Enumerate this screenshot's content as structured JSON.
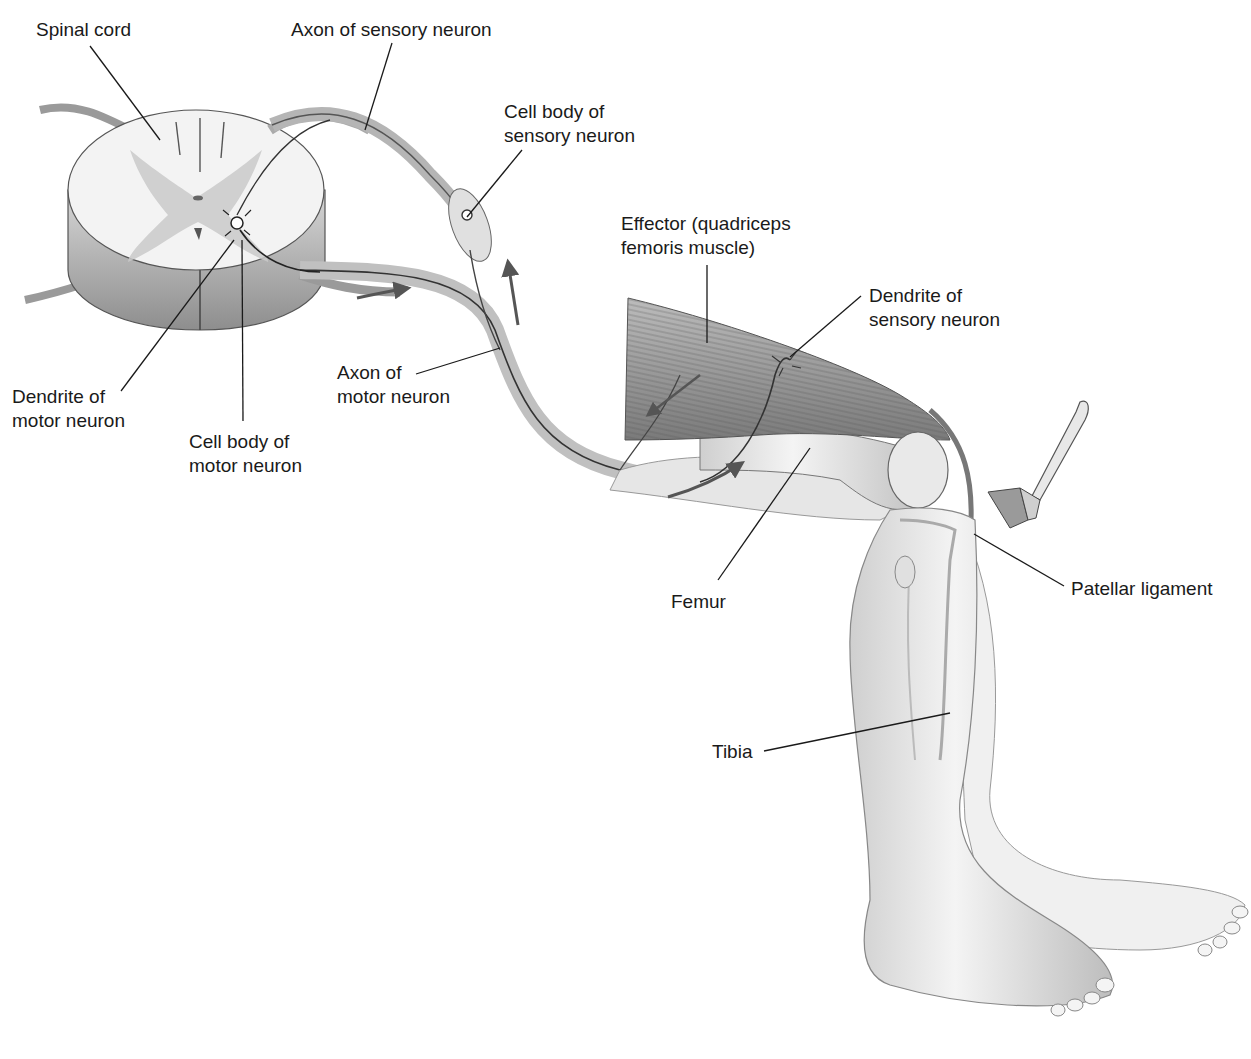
{
  "diagram": {
    "colors": {
      "background": "#ffffff",
      "ink": "#1a1a1a",
      "tissue_light": "#ececec",
      "tissue_mid": "#c9c9c9",
      "tissue_dark": "#8a8a8a",
      "nerve": "#3a3a3a",
      "arrow": "#555555"
    },
    "labels": [
      {
        "id": "spinal-cord",
        "text": "Spinal cord",
        "x": 36,
        "y": 18
      },
      {
        "id": "axon-sensory",
        "text": "Axon of sensory neuron",
        "x": 291,
        "y": 18
      },
      {
        "id": "cell-body-sensory",
        "text": "Cell body of\nsensory neuron",
        "x": 504,
        "y": 100
      },
      {
        "id": "effector",
        "text": "Effector (quadriceps\nfemoris muscle)",
        "x": 621,
        "y": 212
      },
      {
        "id": "dendrite-sensory",
        "text": "Dendrite of\nsensory neuron",
        "x": 869,
        "y": 284
      },
      {
        "id": "axon-motor",
        "text": "Axon of\nmotor neuron",
        "x": 337,
        "y": 361
      },
      {
        "id": "dendrite-motor",
        "text": "Dendrite of\nmotor neuron",
        "x": 12,
        "y": 385
      },
      {
        "id": "cell-body-motor",
        "text": "Cell body of\nmotor neuron",
        "x": 189,
        "y": 430
      },
      {
        "id": "femur",
        "text": "Femur",
        "x": 671,
        "y": 590
      },
      {
        "id": "patellar-ligament",
        "text": "Patellar ligament",
        "x": 1071,
        "y": 577
      },
      {
        "id": "tibia",
        "text": "Tibia",
        "x": 712,
        "y": 740
      }
    ],
    "leader_lines": [
      {
        "label": "spinal-cord",
        "x1": 90,
        "y1": 46,
        "x2": 160,
        "y2": 140
      },
      {
        "label": "axon-sensory",
        "x1": 392,
        "y1": 43,
        "x2": 365,
        "y2": 130
      },
      {
        "label": "cell-body-sensory",
        "x1": 522,
        "y1": 150,
        "x2": 467,
        "y2": 217
      },
      {
        "label": "effector",
        "x1": 707,
        "y1": 265,
        "x2": 707,
        "y2": 343
      },
      {
        "label": "dendrite-sensory",
        "x1": 861,
        "y1": 296,
        "x2": 790,
        "y2": 357
      },
      {
        "label": "axon-motor",
        "x1": 416,
        "y1": 374,
        "x2": 500,
        "y2": 348
      },
      {
        "label": "dendrite-motor",
        "x1": 121,
        "y1": 391,
        "x2": 234,
        "y2": 240
      },
      {
        "label": "cell-body-motor",
        "x1": 243,
        "y1": 421,
        "x2": 242,
        "y2": 240
      },
      {
        "label": "femur",
        "x1": 718,
        "y1": 580,
        "x2": 810,
        "y2": 448
      },
      {
        "label": "patellar-ligament",
        "x1": 1064,
        "y1": 586,
        "x2": 974,
        "y2": 534
      },
      {
        "label": "tibia",
        "x1": 764,
        "y1": 751,
        "x2": 950,
        "y2": 713
      }
    ],
    "arrows": [
      {
        "name": "motor-impulse-arrow-1",
        "path": "M357,298 Q385,292 408,288",
        "head": "408,288"
      },
      {
        "name": "sensory-impulse-arrow",
        "path": "M518,325 L508,262",
        "head": "508,262"
      },
      {
        "name": "motor-impulse-arrow-2",
        "path": "M670,435 L648,415",
        "head": "648,415"
      },
      {
        "name": "sensory-impulse-arrow-2",
        "path": "M668,497 Q710,485 742,463",
        "head": "742,463"
      }
    ],
    "reflex_hammer": {
      "name": "reflex-hammer"
    }
  }
}
